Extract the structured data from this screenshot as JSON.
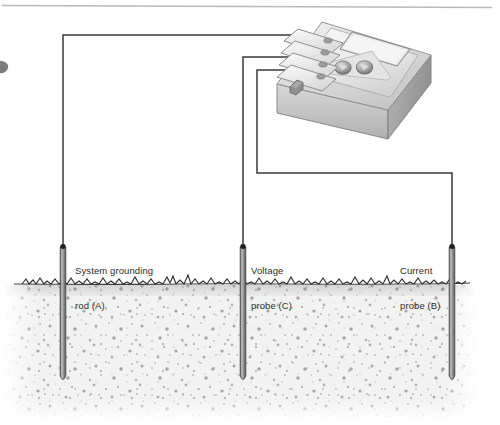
{
  "diagram": {
    "type": "technical-illustration",
    "canvas": {
      "width": 500,
      "height": 425
    },
    "colors": {
      "wire": "#3a3a3a",
      "rod": "#8c8c8c",
      "rod_outline": "#4a4a4a",
      "grass": "#2f2f2f",
      "soil": "#e9e9e9",
      "soil_speck": "#9a9a9a",
      "label_text": "#2b2b2b",
      "meter_top": "#e3e3e3",
      "meter_side": "#b4b4b4",
      "meter_front": "#c9c9c9",
      "panel": "#ededed",
      "knob": "#a8a8a8",
      "rule": "#b9b9b9"
    },
    "labels": [
      {
        "id": "system-grounding-rod",
        "line1": "System grounding",
        "line2": "rod (A)",
        "designator": "A",
        "x": 75,
        "y": 244
      },
      {
        "id": "voltage-probe",
        "line1": "Voltage",
        "line2": "probe (C)",
        "designator": "C",
        "x": 251,
        "y": 244
      },
      {
        "id": "current-probe",
        "line1": "Current",
        "line2": "probe (B)",
        "designator": "B",
        "x": 400,
        "y": 244
      }
    ],
    "rods": [
      {
        "id": "rod-a",
        "label": "System grounding rod (A)",
        "x": 63,
        "top": 246,
        "bottom": 381
      },
      {
        "id": "rod-c",
        "label": "Voltage probe (C)",
        "x": 243,
        "top": 246,
        "bottom": 381
      },
      {
        "id": "rod-b",
        "label": "Current probe (B)",
        "x": 452,
        "top": 246,
        "bottom": 381
      }
    ],
    "wires": [
      {
        "id": "wire-a",
        "from": "rod-a",
        "to": "terminal-1",
        "path": "63,246 63,35 296,35"
      },
      {
        "id": "wire-c",
        "from": "rod-c",
        "to": "terminal-3",
        "path": "243,246 243,58 293,58"
      },
      {
        "id": "wire-b",
        "from": "rod-b",
        "to": "terminal-4",
        "path": "452,246 452,173 257,173 257,70 290,70"
      }
    ],
    "ground": {
      "grass_line_y": 283,
      "soil_top": 285,
      "soil_bottom": 417,
      "left": 4,
      "right": 476
    },
    "meter": {
      "name": "ground-resistance-tester",
      "terminals": [
        {
          "id": "terminal-1",
          "name": "terminal-e"
        },
        {
          "id": "terminal-2",
          "name": "terminal-es"
        },
        {
          "id": "terminal-3",
          "name": "terminal-s"
        },
        {
          "id": "terminal-4",
          "name": "terminal-h"
        }
      ],
      "display": {
        "name": "lcd-display",
        "value": ""
      },
      "knobs": [
        {
          "id": "knob-left",
          "name": "range-knob"
        },
        {
          "id": "knob-right",
          "name": "function-knob"
        }
      ],
      "button": {
        "id": "test-button",
        "name": "test-button"
      }
    }
  }
}
